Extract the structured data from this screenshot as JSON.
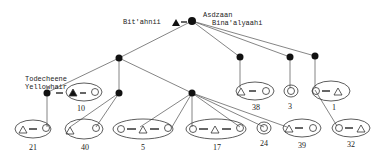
{
  "labels": {
    "father_top": "Bit'ahnii",
    "mother_top_line1": "Asdzaan",
    "mother_top_line2": "Bina'alyaahi",
    "left_line1": "Todecheene",
    "left_line2": "Yellowhair"
  },
  "households": [
    {
      "id": "10",
      "label": "10",
      "members": "filled-triangle = circle"
    },
    {
      "id": "21",
      "label": "21",
      "members": "triangle = circle"
    },
    {
      "id": "40",
      "label": "40",
      "members": "triangle circle"
    },
    {
      "id": "5",
      "label": "5",
      "members": "circle = triangle = circle"
    },
    {
      "id": "17",
      "label": "17",
      "members": "circle = triangle = circle"
    },
    {
      "id": "24",
      "label": "24",
      "members": "circle"
    },
    {
      "id": "39",
      "label": "39",
      "members": "triangle = circle"
    },
    {
      "id": "38",
      "label": "38",
      "members": "triangle = circle"
    },
    {
      "id": "3",
      "label": "3",
      "members": "circle"
    },
    {
      "id": "1",
      "label": "1",
      "members": "circle = triangle"
    },
    {
      "id": "32",
      "label": "32",
      "members": "circle = triangle"
    }
  ],
  "colors": {
    "line": "#555555",
    "node": "#111111",
    "ink": "#222222"
  }
}
